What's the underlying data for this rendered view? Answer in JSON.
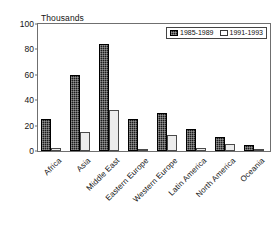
{
  "chart_data": {
    "type": "bar",
    "title": "",
    "subtitle": "",
    "xlabel": "",
    "ylabel": "Thousands",
    "ylim": [
      0,
      100
    ],
    "yticks": [
      0,
      20,
      40,
      60,
      80,
      100
    ],
    "grid": false,
    "legend_position": "top-right",
    "categories": [
      "Africa",
      "Asia",
      "Middle East",
      "Eastern Europe",
      "Western Europe",
      "Latin America",
      "North America",
      "Oceania"
    ],
    "series": [
      {
        "name": "1985-1989",
        "color": "#1d1d1d",
        "values": [
          25,
          60,
          84,
          25,
          30,
          17,
          11,
          5
        ]
      },
      {
        "name": "1991-1993",
        "color": "#ececec",
        "values": [
          2,
          15,
          32,
          1.5,
          13,
          2.5,
          5.5,
          1
        ]
      }
    ]
  },
  "legend": {
    "entries": [
      {
        "label": "1985-1989"
      },
      {
        "label": "1991-1993"
      }
    ]
  },
  "axes": {
    "y_title": "Thousands"
  }
}
